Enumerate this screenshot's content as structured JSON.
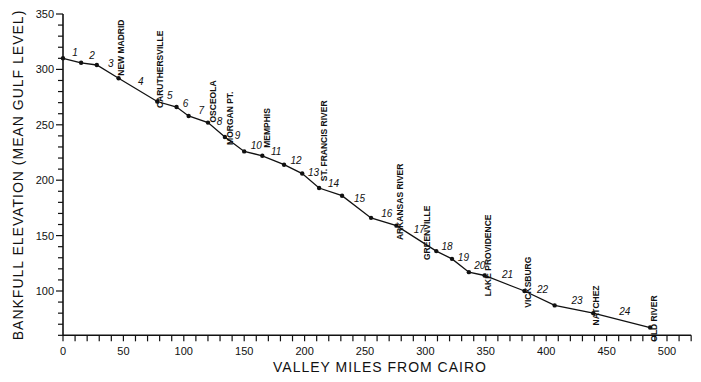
{
  "chart_data": {
    "type": "line",
    "title": "",
    "xlabel": "VALLEY MILES FROM CAIRO",
    "ylabel": "BANKFULL ELEVATION (MEAN GULF LEVEL)",
    "xlim": [
      0,
      520
    ],
    "ylim": [
      60,
      350
    ],
    "x_ticks": [
      0,
      50,
      100,
      150,
      200,
      250,
      300,
      350,
      400,
      450,
      500
    ],
    "y_ticks": [
      100,
      150,
      200,
      250,
      300,
      350
    ],
    "x_minor_step": 10,
    "y_minor_step": 10,
    "grid": false,
    "legend": null,
    "series": [
      {
        "name": "Bankfull elevation",
        "x": [
          0,
          15,
          28,
          46,
          78,
          94,
          104,
          120,
          134,
          150,
          165,
          183,
          198,
          212,
          231,
          255,
          276,
          309,
          322,
          336,
          349,
          382,
          407,
          439,
          486
        ],
        "y": [
          310,
          306,
          304,
          292,
          271,
          266,
          258,
          252,
          239,
          226,
          222,
          214,
          206,
          193,
          186,
          166,
          159,
          136,
          129,
          117,
          114,
          100,
          87,
          80,
          67
        ]
      }
    ],
    "segment_labels": [
      "1",
      "2",
      "3",
      "4",
      "5",
      "6",
      "7",
      "8",
      "9",
      "10",
      "11",
      "12",
      "13",
      "14",
      "15",
      "16",
      "17",
      "18",
      "19",
      "20",
      "21",
      "22",
      "23",
      "24"
    ],
    "annotations": [
      {
        "text": "NEW MADRID",
        "x": 48,
        "y_top": 345
      },
      {
        "text": "CARUTHERSVILLE",
        "x": 80,
        "y_top": 335
      },
      {
        "text": "OSCEOLA",
        "x": 124,
        "y_top": 290
      },
      {
        "text": "MORGAN PT.",
        "x": 138,
        "y_top": 280
      },
      {
        "text": "MEMPHIS",
        "x": 169,
        "y_top": 265
      },
      {
        "text": "ST. FRANCIS RIVER",
        "x": 216,
        "y_top": 272
      },
      {
        "text": "ARKANSAS RIVER",
        "x": 279,
        "y_top": 215
      },
      {
        "text": "GREENVILLE",
        "x": 301,
        "y_top": 177
      },
      {
        "text": "LAKE PROVIDENCE",
        "x": 352,
        "y_top": 169
      },
      {
        "text": "VICKSBURG",
        "x": 385,
        "y_top": 131
      },
      {
        "text": "NATCHEZ",
        "x": 441,
        "y_top": 105
      },
      {
        "text": "OLD RIVER",
        "x": 489,
        "y_top": 96
      }
    ]
  }
}
